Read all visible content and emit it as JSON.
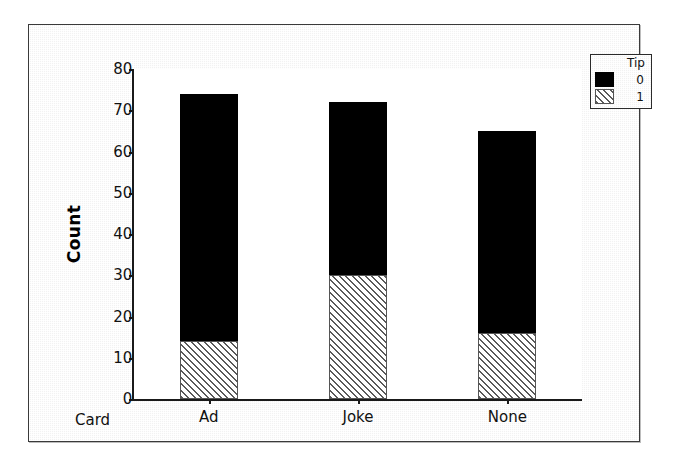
{
  "chart_data": {
    "type": "bar",
    "subtype": "stacked-bar",
    "title": "",
    "xlabel": "Card",
    "ylabel": "Count",
    "categories": [
      "Ad",
      "Joke",
      "None"
    ],
    "series": [
      {
        "name": "0",
        "values": [
          60,
          42,
          49
        ],
        "fill": "solid-black",
        "color": "#000000"
      },
      {
        "name": "1",
        "values": [
          14,
          30,
          16
        ],
        "fill": "diagonal-hatch",
        "color": "#5a5a5a"
      }
    ],
    "stack_order": [
      "1",
      "0"
    ],
    "totals": [
      74,
      72,
      65
    ],
    "ylim": [
      0,
      80
    ],
    "yticks": [
      0,
      10,
      20,
      30,
      40,
      50,
      60,
      70,
      80
    ],
    "ytick_labels": [
      "0",
      "10",
      "20",
      "30",
      "40",
      "50",
      "60",
      "70",
      "80"
    ],
    "grid": false,
    "legend": {
      "title": "Tip",
      "position": "top-right-outside",
      "entries": [
        {
          "label": "0",
          "fill": "solid-black"
        },
        {
          "label": "1",
          "fill": "diagonal-hatch"
        }
      ]
    }
  }
}
